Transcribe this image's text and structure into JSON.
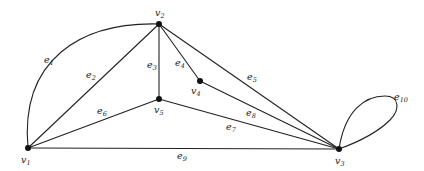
{
  "diagram": {
    "type": "graph",
    "vertices": [
      {
        "id": "v1",
        "label": "v",
        "sub": "1",
        "x": 28,
        "y": 148,
        "lx": 21,
        "ly": 163
      },
      {
        "id": "v2",
        "label": "v",
        "sub": "2",
        "x": 159,
        "y": 24,
        "lx": 155,
        "ly": 16
      },
      {
        "id": "v3",
        "label": "v",
        "sub": "3",
        "x": 339,
        "y": 149,
        "lx": 335,
        "ly": 164
      },
      {
        "id": "v4",
        "label": "v",
        "sub": "4",
        "x": 200,
        "y": 81,
        "lx": 191,
        "ly": 94
      },
      {
        "id": "v5",
        "label": "v",
        "sub": "5",
        "x": 159,
        "y": 99,
        "lx": 154,
        "ly": 113
      }
    ],
    "edges": [
      {
        "id": "e1",
        "label": "e",
        "sub": "1",
        "from": "v1",
        "to": "v2",
        "curve": "M28,148 C20,60 80,22 159,24",
        "lx": 44,
        "ly": 63
      },
      {
        "id": "e2",
        "label": "e",
        "sub": "2",
        "from": "v1",
        "to": "v2",
        "curve": "M28,148 L159,24",
        "lx": 86,
        "ly": 78
      },
      {
        "id": "e3",
        "label": "e",
        "sub": "3",
        "from": "v2",
        "to": "v5",
        "curve": "M159,24 L159,99",
        "lx": 147,
        "ly": 68
      },
      {
        "id": "e4",
        "label": "e",
        "sub": "4",
        "from": "v2",
        "to": "v4",
        "curve": "M159,24 L200,81",
        "lx": 175,
        "ly": 66
      },
      {
        "id": "e5",
        "label": "e",
        "sub": "5",
        "from": "v2",
        "to": "v3",
        "curve": "M159,24 L339,149",
        "lx": 247,
        "ly": 80
      },
      {
        "id": "e6",
        "label": "e",
        "sub": "6",
        "from": "v1",
        "to": "v5",
        "curve": "M28,148 L159,99",
        "lx": 97,
        "ly": 114
      },
      {
        "id": "e7",
        "label": "e",
        "sub": "7",
        "from": "v5",
        "to": "v3",
        "curve": "M159,99 L339,149",
        "lx": 226,
        "ly": 130
      },
      {
        "id": "e8",
        "label": "e",
        "sub": "8",
        "from": "v4",
        "to": "v3",
        "curve": "M200,81 L339,149",
        "lx": 246,
        "ly": 116
      },
      {
        "id": "e9",
        "label": "e",
        "sub": "9",
        "from": "v1",
        "to": "v3",
        "curve": "M28,148 L339,149",
        "lx": 177,
        "ly": 159
      },
      {
        "id": "e10",
        "label": "e",
        "sub": "10",
        "from": "v3",
        "to": "v3",
        "curve": "M339,149 C345,110 365,96 385,96 C400,96 400,110 390,120 C375,135 350,145 339,149",
        "lx": 394,
        "ly": 100
      }
    ]
  }
}
